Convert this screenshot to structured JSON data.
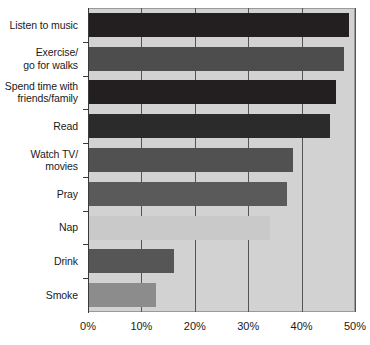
{
  "chart_data": {
    "type": "bar",
    "orientation": "horizontal",
    "title": "",
    "subtitle": "",
    "xlabel": "",
    "ylabel": "",
    "xlim": [
      0,
      50
    ],
    "grid": true,
    "legend": "none",
    "xticks": [
      "0%",
      "10%",
      "20%",
      "30%",
      "40%",
      "50%"
    ],
    "xtick_values": [
      0,
      10,
      20,
      30,
      40,
      50
    ],
    "categories": [
      "Listen to music",
      "Exercise/\ngo for walks",
      "Spend time with\nfriends/family",
      "Read",
      "Watch TV/\nmovies",
      "Pray",
      "Nap",
      "Drink",
      "Smoke"
    ],
    "values": [
      48.8,
      47.9,
      46.5,
      45.3,
      38.4,
      37.3,
      34.1,
      16.1,
      12.7
    ],
    "bar_colors": [
      "#231f20",
      "#4d4d4d",
      "#231f20",
      "#2b2b2b",
      "#515151",
      "#5a5a5a",
      "#c9c9c9",
      "#565656",
      "#8c8c8c"
    ],
    "plot_background": "#d2d2d2",
    "axis_color": "#3a3a3a",
    "grid_color": "#555555",
    "bars": [
      {
        "label": "Listen to music",
        "label_line1": "Listen to music",
        "label_line2": "",
        "value": 48.8,
        "color": "#231f20"
      },
      {
        "label": "Exercise/ go for walks",
        "label_line1": "Exercise/",
        "label_line2": "go for walks",
        "value": 47.9,
        "color": "#4d4d4d"
      },
      {
        "label": "Spend time with friends/family",
        "label_line1": "Spend time with",
        "label_line2": "friends/family",
        "value": 46.5,
        "color": "#231f20"
      },
      {
        "label": "Read",
        "label_line1": "Read",
        "label_line2": "",
        "value": 45.3,
        "color": "#2b2b2b"
      },
      {
        "label": "Watch TV/ movies",
        "label_line1": "Watch TV/",
        "label_line2": "movies",
        "value": 38.4,
        "color": "#515151"
      },
      {
        "label": "Pray",
        "label_line1": "Pray",
        "label_line2": "",
        "value": 37.3,
        "color": "#5a5a5a"
      },
      {
        "label": "Nap",
        "label_line1": "Nap",
        "label_line2": "",
        "value": 34.1,
        "color": "#c9c9c9"
      },
      {
        "label": "Drink",
        "label_line1": "Drink",
        "label_line2": "",
        "value": 16.1,
        "color": "#565656"
      },
      {
        "label": "Smoke",
        "label_line1": "Smoke",
        "label_line2": "",
        "value": 12.7,
        "color": "#8c8c8c"
      }
    ]
  }
}
